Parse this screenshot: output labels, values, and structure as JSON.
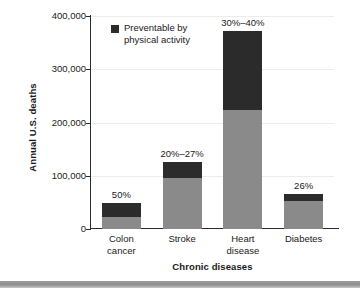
{
  "chart_data": {
    "type": "bar",
    "subtype": "stacked-bar",
    "title": "",
    "xlabel": "Chronic diseases",
    "ylabel": "Annual U.S. deaths",
    "categories": [
      "Colon cancer",
      "Stroke",
      "Heart disease",
      "Diabetes"
    ],
    "category_lines": [
      [
        "Colon",
        "cancer"
      ],
      [
        "Stroke"
      ],
      [
        "Heart",
        "disease"
      ],
      [
        "Diabetes"
      ]
    ],
    "ylim": [
      0,
      400000
    ],
    "yticks": [
      0,
      100000,
      200000,
      300000,
      400000
    ],
    "ytick_labels": [
      "0",
      "100,000",
      "200,000",
      "300,000",
      "400,000"
    ],
    "grid": true,
    "legend_position": "upper-left-inside",
    "series": [
      {
        "name": "Not preventable by physical activity",
        "color": "#8a8a8a",
        "values": [
          23000,
          95000,
          223000,
          53000
        ]
      },
      {
        "name": "Preventable by physical activity",
        "color": "#2b2b2b",
        "values": [
          25000,
          30000,
          148000,
          12000
        ]
      }
    ],
    "totals": [
      48000,
      125000,
      371000,
      65000
    ],
    "annotations": [
      "50%",
      "20%–27%",
      "30%–40%",
      "26%"
    ]
  },
  "legend": {
    "label": "Preventable by physical activity",
    "swatch_color": "#2b2b2b"
  },
  "colors": {
    "preventable": "#2b2b2b",
    "remainder": "#8a8a8a",
    "axis": "#2b2b2b",
    "gridline": "#ececed",
    "page_rule": "#8e8e8e"
  }
}
